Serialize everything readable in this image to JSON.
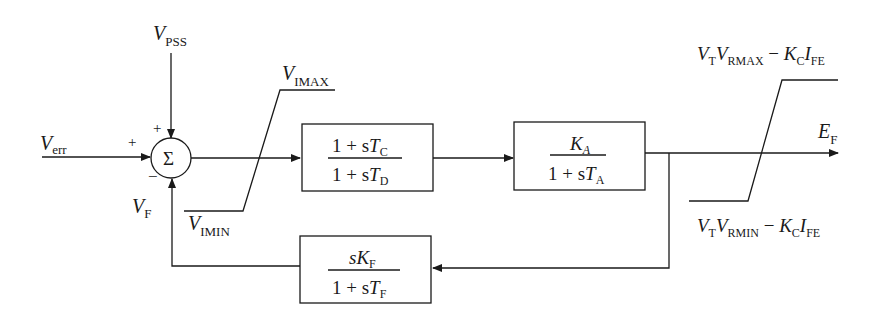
{
  "diagram": {
    "type": "excitation-system-block-diagram",
    "inputs": {
      "v_err": {
        "main": "V",
        "sub": "err",
        "sign": "+"
      },
      "v_pss": {
        "main": "V",
        "sub": "PSS",
        "sign": "+"
      },
      "v_f": {
        "main": "V",
        "sub": "F",
        "sign": "−"
      }
    },
    "summing_junction": {
      "symbol": "Σ"
    },
    "input_limiter": {
      "max": {
        "main": "V",
        "sub": "IMAX"
      },
      "min": {
        "main": "V",
        "sub": "IMIN"
      }
    },
    "lead_lag_block": {
      "num_a": "1 + s",
      "num_b": "T",
      "num_sub": "C",
      "den_a": "1 + s",
      "den_b": "T",
      "den_sub": "D"
    },
    "amplifier_block": {
      "num_a": "K",
      "num_sub": "A",
      "den_a": "1 + s",
      "den_b": "T",
      "den_sub": "A"
    },
    "output_limiter": {
      "max": {
        "v1": "V",
        "v1_sub": "T",
        "v2": "V",
        "v2_sub": "RMAX",
        "op": " − ",
        "k": "K",
        "k_sub": "C",
        "i": "I",
        "i_sub": "FE"
      },
      "min": {
        "v1": "V",
        "v1_sub": "T",
        "v2": "V",
        "v2_sub": "RMIN",
        "op": " − ",
        "k": "K",
        "k_sub": "C",
        "i": "I",
        "i_sub": "FE"
      }
    },
    "output": {
      "main": "E",
      "sub": "F"
    },
    "feedback_block": {
      "num_a": "s",
      "num_b": "K",
      "num_sub": "F",
      "den_a": "1 + s",
      "den_b": "T",
      "den_sub": "F"
    }
  }
}
